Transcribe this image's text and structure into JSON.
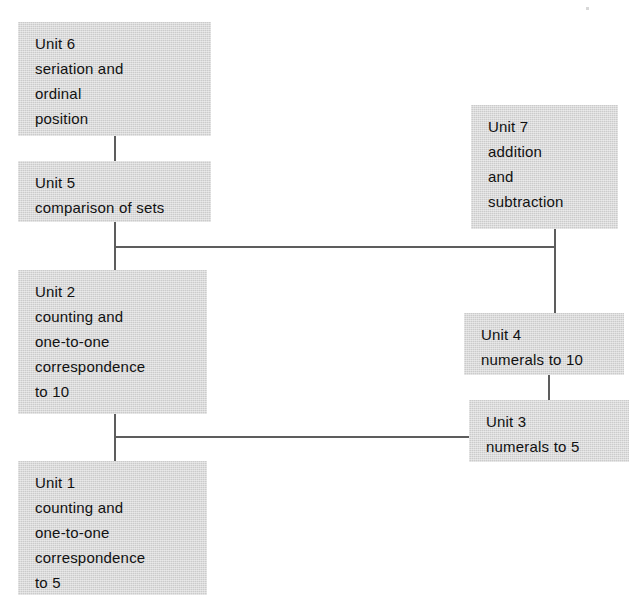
{
  "diagram": {
    "background_color": "#ffffff",
    "box_fill_color": "#cbcbcb",
    "line_color": "#5d5d5d",
    "text_color": "#111111",
    "nodes": [
      {
        "id": "unit-6",
        "label": "Unit 6",
        "lines": [
          "Unit 6",
          "seriation and",
          "ordinal",
          "position"
        ],
        "x": 18,
        "y": 22,
        "w": 193,
        "h": 114
      },
      {
        "id": "unit-5",
        "label": "Unit 5",
        "lines": [
          "Unit 5",
          "comparison of sets"
        ],
        "x": 18,
        "y": 161,
        "w": 193,
        "h": 61
      },
      {
        "id": "unit-2",
        "label": "Unit 2",
        "lines": [
          "Unit 2",
          "counting and",
          "one-to-one",
          "correspondence",
          "to 10"
        ],
        "x": 18,
        "y": 270,
        "w": 189,
        "h": 144
      },
      {
        "id": "unit-1",
        "label": "Unit 1",
        "lines": [
          "Unit 1",
          "counting and",
          "one-to-one",
          "correspondence",
          "to 5"
        ],
        "x": 18,
        "y": 461,
        "w": 189,
        "h": 134
      },
      {
        "id": "unit-7",
        "label": "Unit 7",
        "lines": [
          "Unit 7",
          "addition",
          "and",
          "subtraction"
        ],
        "x": 471,
        "y": 105,
        "w": 147,
        "h": 124
      },
      {
        "id": "unit-4",
        "label": "Unit 4",
        "lines": [
          "Unit 4",
          "numerals to 10"
        ],
        "x": 464,
        "y": 313,
        "w": 160,
        "h": 62
      },
      {
        "id": "unit-3",
        "label": "Unit 3",
        "lines": [
          "Unit 3",
          "numerals to 5"
        ],
        "x": 469,
        "y": 400,
        "w": 160,
        "h": 62
      }
    ],
    "edges": [
      {
        "id": "edge-unit6-unit5",
        "from": "unit-6",
        "to": "unit-5",
        "orientation": "vertical",
        "x": 114,
        "y": 136,
        "length": 25
      },
      {
        "id": "edge-unit5-unit2",
        "from": "unit-5",
        "to": "unit-2",
        "orientation": "vertical",
        "x": 114,
        "y": 222,
        "length": 48
      },
      {
        "id": "edge-unit5-unit7",
        "from": "unit-5",
        "to": "unit-7",
        "orientation": "horizontal",
        "x": 114,
        "y": 246,
        "length": 442
      },
      {
        "id": "edge-unit7-down",
        "from": "unit-7",
        "to": "unit-4",
        "orientation": "vertical",
        "x": 554,
        "y": 229,
        "length": 84
      },
      {
        "id": "edge-unit2-unit1",
        "from": "unit-2",
        "to": "unit-1",
        "orientation": "vertical",
        "x": 114,
        "y": 414,
        "length": 47
      },
      {
        "id": "edge-unit2-unit3",
        "from": "unit-2",
        "to": "unit-3",
        "orientation": "horizontal",
        "x": 114,
        "y": 436,
        "length": 356
      },
      {
        "id": "edge-unit4-unit3",
        "from": "unit-4",
        "to": "unit-3",
        "orientation": "vertical",
        "x": 548,
        "y": 375,
        "length": 26
      }
    ]
  }
}
